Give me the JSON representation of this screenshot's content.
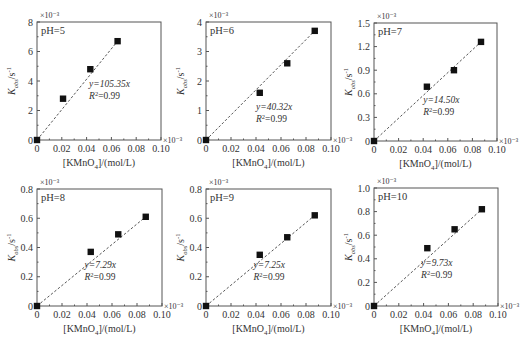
{
  "chart_data": [
    {
      "type": "scatter",
      "title": "pH=5",
      "xlabel": "[KMnO4]/(mol/L)",
      "ylabel": "Kobs/s-1",
      "x_multiplier": "×10⁻³",
      "y_multiplier": "×10⁻³",
      "xlim": [
        0,
        0.1
      ],
      "ylim": [
        0,
        8
      ],
      "xticks": [
        "0",
        "0.02",
        "0.04",
        "0.06",
        "0.08",
        "0.10"
      ],
      "yticks": [
        "0",
        "2",
        "4",
        "6",
        "8"
      ],
      "x": [
        0,
        0.021,
        0.043,
        0.065
      ],
      "y": [
        0,
        2.8,
        4.8,
        6.7
      ],
      "fit": {
        "slope": 105.35,
        "equation": "y=105.35x",
        "r2": "R²=0.99",
        "line_style": "dashed"
      },
      "grid": false
    },
    {
      "type": "scatter",
      "title": "pH=6",
      "xlabel": "[KMnO4]/(mol/L)",
      "ylabel": "Kobs/s-1",
      "x_multiplier": "×10⁻³",
      "y_multiplier": "×10⁻³",
      "xlim": [
        0,
        0.1
      ],
      "ylim": [
        0,
        4
      ],
      "xticks": [
        "0",
        "0.02",
        "0.04",
        "0.06",
        "0.08",
        "0.10"
      ],
      "yticks": [
        "0",
        "1",
        "2",
        "3",
        "4"
      ],
      "x": [
        0,
        0.043,
        0.065,
        0.087
      ],
      "y": [
        0,
        1.6,
        2.6,
        3.7
      ],
      "fit": {
        "slope": 40.32,
        "equation": "y=40.32x",
        "r2": "R²=0.99",
        "line_style": "dashed"
      },
      "grid": false
    },
    {
      "type": "scatter",
      "title": "pH=7",
      "xlabel": "[KMnO4]/(mol/L)",
      "ylabel": "Kobs/s-1",
      "x_multiplier": "×10⁻³",
      "y_multiplier": "×10⁻³",
      "xlim": [
        0,
        0.1
      ],
      "ylim": [
        0,
        1.5
      ],
      "xticks": [
        "0",
        "0.02",
        "0.04",
        "0.06",
        "0.08",
        "0.10"
      ],
      "yticks": [
        "0",
        "0.3",
        "0.6",
        "0.9",
        "1.2",
        "1.5"
      ],
      "x": [
        0,
        0.043,
        0.065,
        0.087
      ],
      "y": [
        0,
        0.69,
        0.9,
        1.26
      ],
      "fit": {
        "slope": 14.5,
        "equation": "y=14.50x",
        "r2": "R²=0.99",
        "line_style": "dashed"
      },
      "grid": false
    },
    {
      "type": "scatter",
      "title": "pH=8",
      "xlabel": "[KMnO4]/(mol/L)",
      "ylabel": "Kobs/s-1",
      "x_multiplier": "×10⁻³",
      "y_multiplier": "×10⁻³",
      "xlim": [
        0,
        0.1
      ],
      "ylim": [
        0,
        0.8
      ],
      "xticks": [
        "0",
        "0.02",
        "0.04",
        "0.06",
        "0.08",
        "0.10"
      ],
      "yticks": [
        "0",
        "0.2",
        "0.4",
        "0.6",
        "0.8"
      ],
      "x": [
        0,
        0.043,
        0.065,
        0.087
      ],
      "y": [
        0,
        0.37,
        0.49,
        0.61
      ],
      "fit": {
        "slope": 7.29,
        "equation": "y=7.29x",
        "r2": "R²=0.99",
        "line_style": "dashed"
      },
      "grid": false
    },
    {
      "type": "scatter",
      "title": "pH=9",
      "xlabel": "[KMnO4]/(mol/L)",
      "ylabel": "Kobs/s-1",
      "x_multiplier": "×10⁻³",
      "y_multiplier": "×10⁻³",
      "xlim": [
        0,
        0.1
      ],
      "ylim": [
        0,
        0.8
      ],
      "xticks": [
        "0",
        "0.02",
        "0.04",
        "0.06",
        "0.08",
        "0.10"
      ],
      "yticks": [
        "0",
        "0.2",
        "0.4",
        "0.6",
        "0.8"
      ],
      "x": [
        0,
        0.043,
        0.065,
        0.087
      ],
      "y": [
        0,
        0.35,
        0.47,
        0.62
      ],
      "fit": {
        "slope": 7.25,
        "equation": "y=7.25x",
        "r2": "R²=0.99",
        "line_style": "dashed"
      },
      "grid": false
    },
    {
      "type": "scatter",
      "title": "pH=10",
      "xlabel": "[KMnO4]/(mol/L)",
      "ylabel": "Kobs/s-1",
      "x_multiplier": "×10⁻³",
      "y_multiplier": "×10⁻³",
      "xlim": [
        0,
        0.1
      ],
      "ylim": [
        0,
        1.0
      ],
      "xticks": [
        "0",
        "0.02",
        "0.04",
        "0.06",
        "0.08",
        "0.10"
      ],
      "yticks": [
        "0",
        "0.2",
        "0.4",
        "0.6",
        "0.8",
        "1.0"
      ],
      "x": [
        0,
        0.043,
        0.065,
        0.087
      ],
      "y": [
        0,
        0.49,
        0.65,
        0.82
      ],
      "fit": {
        "slope": 9.73,
        "equation": "y=9.73x",
        "r2": "R²=0.99",
        "line_style": "dashed"
      },
      "grid": false
    }
  ],
  "layout": {
    "panels": [
      {
        "left": 37,
        "top": 22,
        "right": 161,
        "bottom": 140
      },
      {
        "left": 206,
        "top": 22,
        "right": 331,
        "bottom": 140
      },
      {
        "left": 374,
        "top": 23,
        "right": 497,
        "bottom": 141
      },
      {
        "left": 37,
        "top": 189,
        "right": 162,
        "bottom": 306
      },
      {
        "left": 206,
        "top": 189,
        "right": 331,
        "bottom": 306
      },
      {
        "left": 374,
        "top": 188,
        "right": 498,
        "bottom": 306
      }
    ],
    "annotation_pos": [
      [
        0.42,
        0.35
      ],
      [
        0.4,
        0.15
      ],
      [
        0.4,
        0.22
      ],
      [
        0.38,
        0.22
      ],
      [
        0.38,
        0.22
      ],
      [
        0.38,
        0.24
      ]
    ]
  },
  "colors": {
    "axis": "#555555",
    "marker": "#111111",
    "fit_line": "#555555",
    "text": "#333333"
  }
}
